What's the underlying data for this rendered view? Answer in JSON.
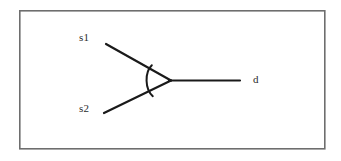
{
  "figure": {
    "type": "diagram",
    "kind": "merge-junction",
    "background_color": "#ffffff",
    "frame": {
      "name": "figure-border",
      "x": 19,
      "y": 10,
      "width": 306,
      "height": 139,
      "stroke_color": "#6e6e6e",
      "stroke_width": 1.6,
      "fill": "none"
    },
    "stroke_color": "#1a1a1a",
    "stroke_width": 2.2,
    "labels": [
      {
        "id": "s1",
        "text": "s1",
        "x": 79,
        "y": 32
      },
      {
        "id": "s2",
        "text": "s2",
        "x": 79,
        "y": 103
      },
      {
        "id": "d",
        "text": "d",
        "x": 253,
        "y": 74
      }
    ],
    "edges": [
      {
        "id": "edge-s1",
        "from": "s1",
        "to": "vertex",
        "x1": 106,
        "y1": 44,
        "x2": 170,
        "y2": 80
      },
      {
        "id": "edge-s2",
        "from": "s2",
        "to": "vertex",
        "x1": 104,
        "y1": 113,
        "x2": 170,
        "y2": 80
      },
      {
        "id": "edge-d",
        "from": "vertex",
        "to": "d",
        "x1": 170,
        "y1": 80,
        "x2": 240,
        "y2": 80
      }
    ],
    "vertex": {
      "id": "vertex",
      "x": 170,
      "y": 80
    },
    "angle_arc": {
      "id": "angle-arc",
      "path": "M 150.5 65.5 A 20 20 0 0 0 151.5 95.0",
      "stroke_color": "#1a1a1a",
      "stroke_width": 2.0
    }
  }
}
